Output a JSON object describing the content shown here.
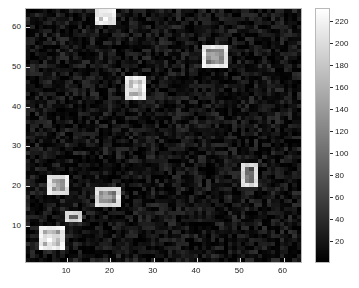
{
  "figure": {
    "background": "#ffffff",
    "axes_bg": "#0a0a0a",
    "axes_edge": "#b9b9b9",
    "tick_color": "#d9d9d9",
    "text_color": "#1a1a1a"
  },
  "axes": {
    "x_ticks": [
      10,
      20,
      30,
      40,
      50,
      60
    ],
    "y_ticks": [
      10,
      20,
      30,
      40,
      50,
      60
    ],
    "x_tick_labels": [
      "10",
      "20",
      "30",
      "40",
      "50",
      "60"
    ],
    "y_tick_labels": [
      "10",
      "20",
      "30",
      "40",
      "50",
      "60"
    ],
    "xlim": [
      0.5,
      64.5
    ],
    "ylim": [
      0.5,
      64.5
    ],
    "xlabel": "",
    "ylabel": "",
    "title": ""
  },
  "colorbar": {
    "ticks": [
      20,
      40,
      60,
      80,
      100,
      120,
      140,
      160,
      180,
      200,
      220
    ],
    "tick_labels": [
      "20",
      "40",
      "60",
      "80",
      "100",
      "120",
      "140",
      "160",
      "180",
      "200",
      "220"
    ],
    "range": [
      0,
      232
    ],
    "colormap": "gray",
    "orientation": "vertical",
    "position": "right"
  },
  "chart_data": {
    "type": "heatmap",
    "title": "",
    "xlabel": "",
    "ylabel": "",
    "grid": false,
    "legend_position": "right",
    "colormap": "gray",
    "colorbar_label": "",
    "xlim": [
      0.5,
      64.5
    ],
    "ylim": [
      0.5,
      64.5
    ],
    "zlim": [
      0,
      232
    ],
    "grid_size": [
      64,
      64
    ],
    "background_noise": {
      "description": "dark uniform random noise background",
      "mean": 14,
      "min": 0,
      "max": 45
    },
    "features": [
      {
        "id": 1,
        "cx": 19.0,
        "cy": 62.5,
        "w": 4.0,
        "h": 3.5,
        "peak": 215,
        "border_value": 230
      },
      {
        "id": 2,
        "cx": 44.5,
        "cy": 52.5,
        "w": 5.5,
        "h": 5.0,
        "peak": 150,
        "border_value": 225
      },
      {
        "id": 3,
        "cx": 26.0,
        "cy": 44.5,
        "w": 4.5,
        "h": 5.0,
        "peak": 195,
        "border_value": 228
      },
      {
        "id": 4,
        "cx": 52.0,
        "cy": 22.0,
        "w": 3.0,
        "h": 5.0,
        "peak": 120,
        "border_value": 215
      },
      {
        "id": 5,
        "cx": 7.5,
        "cy": 20.0,
        "w": 4.0,
        "h": 4.0,
        "peak": 170,
        "border_value": 222
      },
      {
        "id": 6,
        "cx": 19.0,
        "cy": 17.0,
        "w": 5.0,
        "h": 4.0,
        "peak": 160,
        "border_value": 218
      },
      {
        "id": 7,
        "cx": 11.5,
        "cy": 11.8,
        "w": 3.5,
        "h": 1.6,
        "peak": 95,
        "border_value": 205
      },
      {
        "id": 8,
        "cx": 6.5,
        "cy": 6.5,
        "w": 4.5,
        "h": 5.0,
        "peak": 230,
        "border_value": 232
      }
    ]
  }
}
